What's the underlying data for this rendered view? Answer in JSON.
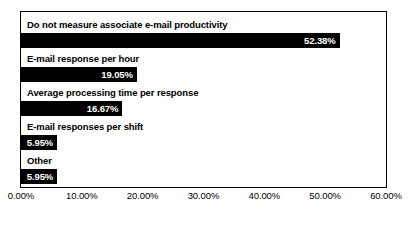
{
  "chart_data": {
    "type": "bar",
    "orientation": "horizontal",
    "title": "",
    "subtitle": "",
    "xlabel": "",
    "ylabel": "",
    "categories": [
      "Do not measure associate e-mail productivity",
      "E-mail response per hour",
      "Average processing time per response",
      "E-mail responses per shift",
      "Other"
    ],
    "values": [
      52.38,
      19.05,
      16.67,
      5.95,
      5.95
    ],
    "value_labels": [
      "52.38%",
      "19.05%",
      "16.67%",
      "5.95%",
      "5.95%"
    ],
    "xlim": [
      0,
      60
    ],
    "xtick_values": [
      0,
      10,
      20,
      30,
      40,
      50,
      60
    ],
    "xtick_labels": [
      "0.00%",
      "10.00%",
      "20.00%",
      "30.00%",
      "40.00%",
      "50.00%",
      "60.00%"
    ],
    "grid": false,
    "legend": null,
    "bar_color": "#000000",
    "value_label_color": "#ffffff",
    "category_label_color": "#000000",
    "plot_background": "#ffffff",
    "frame_color": "#000000"
  }
}
